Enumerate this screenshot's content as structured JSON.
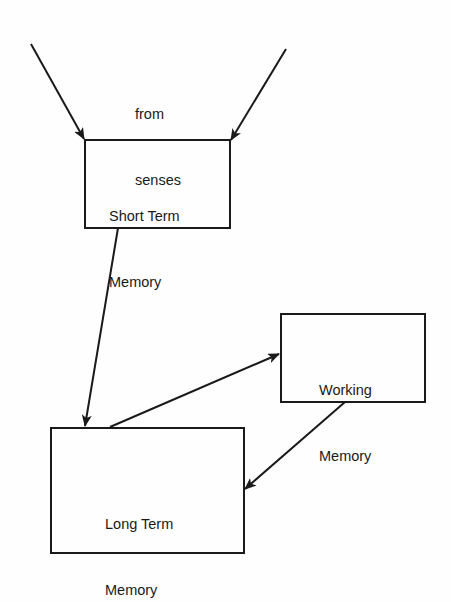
{
  "diagram": {
    "input_label": {
      "line1": "from",
      "line2": "senses"
    },
    "nodes": {
      "short_term": {
        "line1": "Short Term",
        "line2": "Memory"
      },
      "working": {
        "line1": "Working",
        "line2": "Memory"
      },
      "long_term": {
        "line1": "Long Term",
        "line2": "Memory"
      }
    },
    "edges": [
      {
        "from": "senses (left)",
        "to": "Short Term Memory"
      },
      {
        "from": "senses (right)",
        "to": "Short Term Memory"
      },
      {
        "from": "Short Term Memory",
        "to": "Long Term Memory"
      },
      {
        "from": "Long Term Memory",
        "to": "Working Memory"
      },
      {
        "from": "Working Memory",
        "to": "Long Term Memory"
      }
    ],
    "line_color": "#1a1a1a",
    "background": "#fefefe"
  }
}
